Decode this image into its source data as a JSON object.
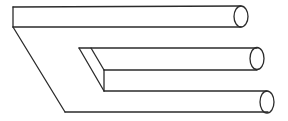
{
  "figure": {
    "title": "Impossible trident (blivet) optical illusion",
    "stroke_color": "#2b2b2b",
    "background_color": "#ffffff",
    "prong_count": 3
  }
}
